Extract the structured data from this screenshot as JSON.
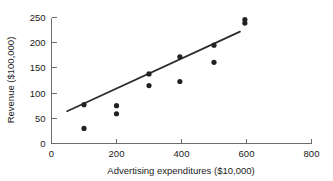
{
  "chart_data": {
    "type": "scatter",
    "title": "",
    "xlabel": "Advertising expenditures ($10,000)",
    "ylabel": "Revenue ($100,000)",
    "xlim": [
      0,
      800
    ],
    "ylim": [
      0,
      250
    ],
    "xticks": [
      0,
      200,
      400,
      600,
      800
    ],
    "yticks": [
      0,
      50,
      100,
      150,
      200,
      250
    ],
    "xtick_labels": [
      "0",
      "200",
      "400",
      "600",
      "800"
    ],
    "ytick_labels": [
      "0",
      "50",
      "100",
      "150",
      "200",
      "250"
    ],
    "grid": false,
    "legend": false,
    "points": [
      {
        "x": 100,
        "y": 77
      },
      {
        "x": 100,
        "y": 30
      },
      {
        "x": 200,
        "y": 75
      },
      {
        "x": 200,
        "y": 59
      },
      {
        "x": 300,
        "y": 138
      },
      {
        "x": 300,
        "y": 115
      },
      {
        "x": 395,
        "y": 172
      },
      {
        "x": 395,
        "y": 123
      },
      {
        "x": 500,
        "y": 195
      },
      {
        "x": 500,
        "y": 161
      },
      {
        "x": 595,
        "y": 246
      },
      {
        "x": 595,
        "y": 239
      }
    ],
    "series": [
      {
        "name": "Revenue observations",
        "x": [
          100,
          100,
          200,
          200,
          300,
          300,
          395,
          395,
          500,
          500,
          595,
          595
        ],
        "values": [
          77,
          30,
          75,
          59,
          138,
          115,
          172,
          123,
          195,
          161,
          246,
          239
        ]
      }
    ],
    "trendline": {
      "type": "linear-fit",
      "x_start": 48,
      "y_start": 64,
      "x_end": 580,
      "y_end": 222
    }
  },
  "figure": {
    "marker_radius": 2.6,
    "point_color": "#222222",
    "line_color": "#2b2b2b",
    "axis_color": "#6e6e6e",
    "background": "#ffffff"
  }
}
